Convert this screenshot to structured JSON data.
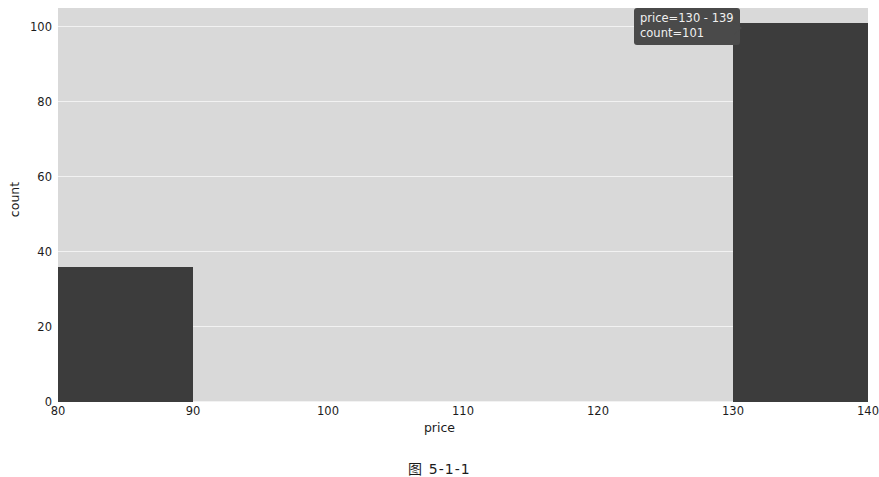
{
  "figure": {
    "caption": "图 5-1-1",
    "background": "#ffffff",
    "plot_background": "#d9d9d9",
    "gridline_color": "#f2f2f2",
    "bar_color": "#3c3c3c"
  },
  "tooltip": {
    "line1": "price=130 - 139",
    "line2": "count=101",
    "background": "#4a4a4a",
    "text_color": "#f0f0f0"
  },
  "chart_data": {
    "type": "bar",
    "title": "",
    "subtitle": "",
    "xlabel": "price",
    "ylabel": "count",
    "xlim": [
      80,
      140
    ],
    "ylim": [
      0,
      105
    ],
    "grid": "horizontal",
    "legend": "none",
    "xticks": [
      80,
      90,
      100,
      110,
      120,
      130,
      140
    ],
    "xtick_labels": [
      "80",
      "90",
      "100",
      "110",
      "120",
      "130",
      "140"
    ],
    "yticks": [
      0,
      20,
      40,
      60,
      80,
      100
    ],
    "ytick_labels": [
      "0",
      "20",
      "40",
      "60",
      "80",
      "100"
    ],
    "bins": [
      {
        "label": "80 - 89",
        "x0": 80,
        "x1": 90,
        "value": 36
      },
      {
        "label": "130 - 139",
        "x0": 130,
        "x1": 140,
        "value": 101
      }
    ],
    "annotations": [
      {
        "text": "price=130 - 139",
        "target_bin": "130 - 139"
      },
      {
        "text": "count=101",
        "target_bin": "130 - 139"
      }
    ]
  }
}
